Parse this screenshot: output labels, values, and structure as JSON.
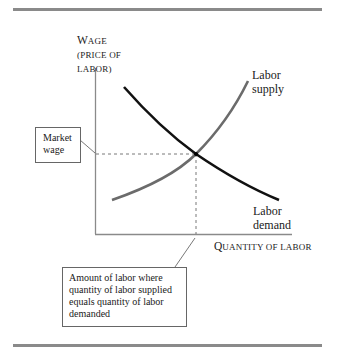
{
  "y_axis": {
    "label_line1_big": "W",
    "label_line1_rest": "AGE",
    "label_line2": "(PRICE OF",
    "label_line3": "LABOR)"
  },
  "x_axis": {
    "label_big": "Q",
    "label_rest": "UANTITY OF LABOR"
  },
  "curves": {
    "supply": {
      "label_line1": "Labor",
      "label_line2": "supply",
      "color": "#6b6b6b"
    },
    "demand": {
      "label_line1": "Labor",
      "label_line2": "demand",
      "color": "#111111"
    }
  },
  "callouts": {
    "market_wage": {
      "line1": "Market",
      "line2": "wage"
    },
    "equilibrium_quantity": {
      "line1": "Amount of labor where",
      "line2": "quantity of labor supplied",
      "line3": "equals quantity of labor",
      "line4": "demanded"
    }
  },
  "colors": {
    "axis": "#8a8a8a",
    "rule": "#8a8a8a"
  }
}
